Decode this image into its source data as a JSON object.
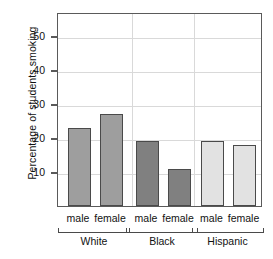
{
  "chart_data": {
    "type": "bar",
    "title": "",
    "subtitle": "",
    "xlabel": "",
    "ylabel": "Percentage of students smoking",
    "ylim": [
      0,
      57
    ],
    "yticks": [
      10,
      20,
      30,
      40,
      50
    ],
    "ytick_labels": [
      "10",
      "20",
      "30",
      "40",
      "50"
    ],
    "grid": true,
    "legend": "none",
    "group_label": "",
    "sex_categories": [
      "male",
      "female"
    ],
    "groups": [
      {
        "name": "White",
        "color": "#9e9e9e",
        "bars": [
          {
            "category": "male",
            "value": 23
          },
          {
            "category": "female",
            "value": 27
          }
        ]
      },
      {
        "name": "Black",
        "color": "#808080",
        "bars": [
          {
            "category": "male",
            "value": 19
          },
          {
            "category": "female",
            "value": 11
          }
        ]
      },
      {
        "name": "Hispanic",
        "color": "#e2e2e2",
        "bars": [
          {
            "category": "male",
            "value": 19
          },
          {
            "category": "female",
            "value": 18
          }
        ]
      }
    ],
    "categories": [
      "White male",
      "White female",
      "Black male",
      "Black female",
      "Hispanic male",
      "Hispanic female"
    ],
    "values": [
      23,
      27,
      19,
      11,
      19,
      18
    ],
    "colors": {
      "white_group": "#9e9e9e",
      "black_group": "#808080",
      "hispanic_group": "#e2e2e2",
      "bar_outline": "#4a4a4a",
      "frame": "#5a5a5a",
      "gridline": "#d9d9d9",
      "background": "#ffffff",
      "text": "#111111"
    }
  }
}
